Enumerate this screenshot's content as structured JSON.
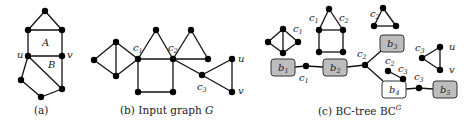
{
  "panels": [
    {
      "id": "a",
      "caption": "(a)",
      "caption_x": 34,
      "region_labels": [
        {
          "text": "A",
          "x": 42,
          "y": 46
        },
        {
          "text": "B",
          "x": 48,
          "y": 68
        }
      ],
      "vertex_labels": [
        {
          "text": "u",
          "x": 17,
          "y": 58
        },
        {
          "text": "v",
          "x": 67,
          "y": 58
        }
      ],
      "nodes": [
        [
          45,
          11
        ],
        [
          28,
          30
        ],
        [
          62,
          30
        ],
        [
          28,
          56
        ],
        [
          62,
          56
        ],
        [
          21,
          80
        ],
        [
          62,
          89
        ],
        [
          41,
          97
        ]
      ],
      "edges": [
        [
          0,
          1
        ],
        [
          0,
          2
        ],
        [
          1,
          2
        ],
        [
          1,
          3
        ],
        [
          2,
          4
        ],
        [
          3,
          4
        ],
        [
          3,
          5
        ],
        [
          3,
          6
        ],
        [
          4,
          6
        ],
        [
          5,
          7
        ],
        [
          6,
          7
        ]
      ]
    },
    {
      "id": "b",
      "caption_prefix": "(b) Input graph ",
      "caption_var": "G",
      "caption_x": 120,
      "vertex_labels": [
        {
          "text": "c",
          "sub": "1",
          "x": 133,
          "y": 51
        },
        {
          "text": "c",
          "sub": "2",
          "x": 168,
          "y": 51
        },
        {
          "text": "c",
          "sub": "3",
          "x": 197,
          "y": 90
        },
        {
          "text": "u",
          "x": 238,
          "y": 62
        },
        {
          "text": "v",
          "x": 238,
          "y": 94
        }
      ],
      "nodes": [
        [
          94,
          60
        ],
        [
          116,
          42
        ],
        [
          116,
          76
        ],
        [
          138,
          59
        ],
        [
          156,
          30
        ],
        [
          173,
          59
        ],
        [
          191,
          30
        ],
        [
          208,
          59
        ],
        [
          138,
          92
        ],
        [
          173,
          92
        ],
        [
          202,
          75
        ],
        [
          232,
          59
        ],
        [
          232,
          92
        ]
      ],
      "edges": [
        [
          0,
          1
        ],
        [
          0,
          2
        ],
        [
          1,
          2
        ],
        [
          1,
          3
        ],
        [
          2,
          3
        ],
        [
          3,
          4
        ],
        [
          4,
          5
        ],
        [
          3,
          5
        ],
        [
          5,
          6
        ],
        [
          6,
          7
        ],
        [
          5,
          7
        ],
        [
          3,
          8
        ],
        [
          8,
          9
        ],
        [
          9,
          5
        ],
        [
          5,
          10
        ],
        [
          10,
          11
        ],
        [
          10,
          12
        ],
        [
          11,
          12
        ]
      ]
    },
    {
      "id": "c",
      "caption_prefix": "(c) BC-tree BC",
      "caption_sup": "G",
      "caption_x": 318,
      "blocks": [
        {
          "label": "b",
          "sub": "1",
          "x": 271,
          "y": 59,
          "w": 24,
          "h": 17,
          "gray": true
        },
        {
          "label": "b",
          "sub": "2",
          "x": 323,
          "y": 59,
          "w": 24,
          "h": 17,
          "gray": true
        },
        {
          "label": "b",
          "sub": "3",
          "x": 380,
          "y": 35,
          "w": 24,
          "h": 17,
          "gray": true
        },
        {
          "label": "b",
          "sub": "4",
          "x": 382,
          "y": 81,
          "w": 24,
          "h": 17,
          "gray": false
        },
        {
          "label": "b",
          "sub": "5",
          "x": 433,
          "y": 81,
          "w": 24,
          "h": 17,
          "gray": true
        }
      ],
      "cut_vertices": [
        {
          "label": "c",
          "sub": "1",
          "x": 306,
          "y": 66,
          "lx": 299,
          "ly": 81
        },
        {
          "label": "c",
          "sub": "2",
          "x": 365,
          "y": 65,
          "lx": 357,
          "ly": 57
        },
        {
          "label": "c",
          "sub": "3",
          "x": 419,
          "y": 88,
          "lx": 414,
          "ly": 80
        }
      ],
      "tree_edges": [
        [
          295,
          67,
          306,
          66
        ],
        [
          306,
          66,
          323,
          67
        ],
        [
          347,
          67,
          365,
          65
        ],
        [
          365,
          65,
          381,
          51
        ],
        [
          365,
          65,
          383,
          81
        ],
        [
          406,
          89,
          419,
          88
        ],
        [
          419,
          88,
          433,
          89
        ]
      ],
      "block_graphs": [
        {
          "nodes": [
            [
              268,
              42
            ],
            [
              283,
              29
            ],
            [
              298,
              42
            ],
            [
              283,
              53
            ]
          ],
          "edges": [
            [
              0,
              1
            ],
            [
              0,
              3
            ],
            [
              1,
              3
            ],
            [
              1,
              2
            ],
            [
              2,
              3
            ]
          ],
          "labels": [
            {
              "text": "c",
              "sub": "1",
              "x": 293,
              "y": 32
            }
          ]
        },
        {
          "nodes": [
            [
              329,
              9
            ],
            [
              319,
              30
            ],
            [
              343,
              30
            ],
            [
              319,
              52
            ],
            [
              343,
              52
            ]
          ],
          "edges": [
            [
              0,
              1
            ],
            [
              0,
              2
            ],
            [
              1,
              2
            ],
            [
              1,
              3
            ],
            [
              2,
              4
            ],
            [
              3,
              4
            ]
          ],
          "labels": [
            {
              "text": "c",
              "sub": "1",
              "x": 309,
              "y": 21
            },
            {
              "text": "c",
              "sub": "2",
              "x": 339,
              "y": 21
            }
          ]
        },
        {
          "nodes": [
            [
              383,
              8
            ],
            [
              374,
              26
            ],
            [
              396,
              26
            ]
          ],
          "edges": [
            [
              0,
              1
            ],
            [
              0,
              2
            ],
            [
              1,
              2
            ]
          ],
          "labels": [
            {
              "text": "c",
              "sub": "2",
              "x": 370,
              "y": 17
            }
          ]
        },
        {
          "nodes": [
            [
              388,
              71
            ],
            [
              403,
              79
            ]
          ],
          "edges": [
            [
              0,
              1
            ]
          ],
          "labels": [
            {
              "text": "c",
              "sub": "2",
              "x": 385,
              "y": 64
            },
            {
              "text": "c",
              "sub": "3",
              "x": 398,
              "y": 72
            }
          ]
        },
        {
          "nodes": [
            [
              422,
              58
            ],
            [
              440,
              47
            ],
            [
              440,
              70
            ]
          ],
          "edges": [
            [
              0,
              1
            ],
            [
              0,
              2
            ],
            [
              1,
              2
            ]
          ],
          "labels": [
            {
              "text": "c",
              "sub": "3",
              "x": 415,
              "y": 51
            },
            {
              "text": "u",
              "x": 449,
              "y": 50
            },
            {
              "text": "v",
              "x": 449,
              "y": 73
            }
          ]
        }
      ]
    }
  ]
}
